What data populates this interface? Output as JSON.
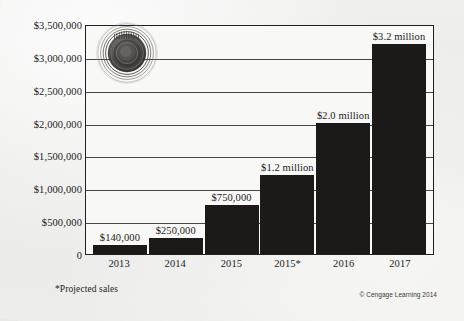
{
  "chart_data": {
    "type": "bar",
    "title": "",
    "subtitle": "",
    "xlabel": "",
    "ylabel": "",
    "categories": [
      "2013",
      "2014",
      "2015",
      "2015*",
      "2016",
      "2017"
    ],
    "values": [
      140000,
      250000,
      750000,
      1200000,
      2000000,
      3200000
    ],
    "data_labels": [
      "$140,000",
      "$250,000",
      "$750,000",
      "$1.2 million",
      "$2.0 million",
      "$3.2 million"
    ],
    "ylim": [
      0,
      3500000
    ],
    "ytick_values": [
      0,
      500000,
      1000000,
      1500000,
      2000000,
      2500000,
      3000000,
      3500000
    ],
    "ytick_labels": [
      "0",
      "$500,000",
      "$1,000,000",
      "$1,500,000",
      "$2,000,000",
      "$2,500,000",
      "$3,000,000",
      "$3,500,000"
    ],
    "grid": true,
    "legend": null,
    "bar_color": "#1b1a19",
    "plot_background": "#f8f8f6",
    "annotations": [
      "*Projected sales"
    ]
  },
  "figure": {
    "footnote": "*Projected sales",
    "copyright": "© Cengage Learning 2014",
    "watermark": "circular-seal-watermark",
    "page_background": "#ececea"
  }
}
